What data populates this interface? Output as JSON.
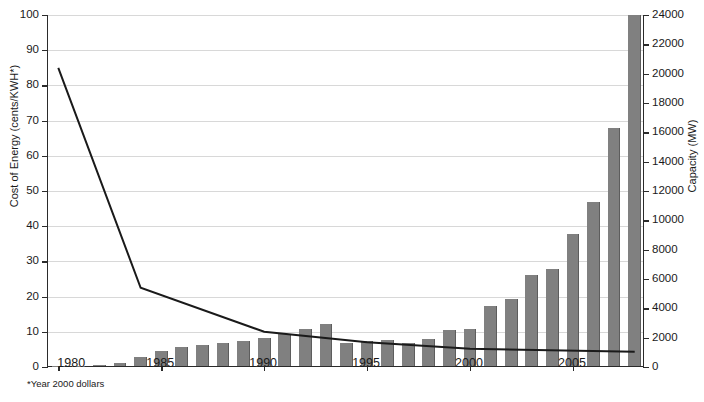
{
  "axes": {
    "left_title": "Cost of Energy (cents/KWH*)",
    "right_title": "Capacity (MW)",
    "left_ticks": [
      0,
      10,
      20,
      30,
      40,
      50,
      60,
      70,
      80,
      90,
      100
    ],
    "right_ticks": [
      0,
      2000,
      4000,
      6000,
      8000,
      10000,
      12000,
      14000,
      16000,
      18000,
      20000,
      22000,
      24000
    ],
    "x_ticks": [
      1980,
      1985,
      1990,
      1995,
      2000,
      2005
    ]
  },
  "footnote": "*Year 2000 dollars",
  "chart_data": {
    "type": "bar",
    "title": "",
    "xlabel": "",
    "ylabel": "Cost of Energy (cents/KWH*)",
    "y2label": "Capacity (MW)",
    "ylim": [
      0,
      100
    ],
    "y2lim": [
      0,
      24000
    ],
    "xlim": [
      1979.5,
      2008.5
    ],
    "grid": true,
    "legend": "none",
    "categories": [
      1980,
      1981,
      1982,
      1983,
      1984,
      1985,
      1986,
      1987,
      1988,
      1989,
      1990,
      1991,
      1992,
      1993,
      1994,
      1995,
      1996,
      1997,
      1998,
      1999,
      2000,
      2001,
      2002,
      2003,
      2004,
      2005,
      2006,
      2007,
      2008
    ],
    "series": [
      {
        "name": "Capacity (MW)",
        "type": "bar",
        "axis": "right",
        "units": "MW",
        "values": [
          10,
          25,
          90,
          200,
          600,
          1020,
          1270,
          1450,
          1580,
          1730,
          1930,
          2170,
          2510,
          2880,
          1600,
          1700,
          1750,
          1600,
          1850,
          2450,
          2500,
          4100,
          4600,
          6200,
          6600,
          9000,
          11200,
          16200,
          23900
        ]
      },
      {
        "name": "Cost of Energy (cents/KWH*)",
        "type": "line",
        "axis": "left",
        "units": "cents/KWH",
        "color": "#1a1a1a",
        "x": [
          1980,
          1984,
          1990,
          1995,
          2000,
          2008
        ],
        "values": [
          85,
          22.5,
          10,
          7,
          5.2,
          4.3
        ]
      }
    ]
  }
}
